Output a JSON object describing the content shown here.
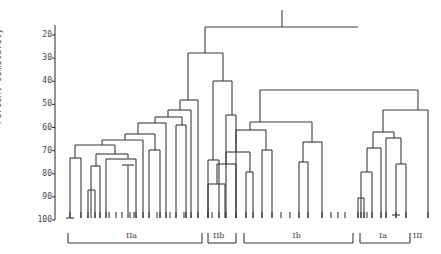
{
  "chart_data": {
    "type": "dendrogram",
    "title": "",
    "ylabel": "Percent similarity",
    "xlabel": "",
    "ylim": [
      20,
      100
    ],
    "yticks": [
      20,
      30,
      40,
      50,
      60,
      70,
      80,
      90,
      100
    ],
    "groups": [
      {
        "label": "IIa",
        "x1": 68,
        "x2": 202
      },
      {
        "label": "IIb",
        "x1": 208,
        "x2": 236
      },
      {
        "label": "Ib",
        "x1": 244,
        "x2": 353
      },
      {
        "label": "Ia",
        "x1": 360,
        "x2": 410
      },
      {
        "label": "III",
        "x1": 412,
        "x2": 412
      }
    ],
    "approx_merge_levels": {
      "root": 23,
      "II_cluster": 31,
      "IIb_internal": 40,
      "IIa_top": 48,
      "I_cluster": 45,
      "Ib_top": 60,
      "Ia_plus_III": 53,
      "Ia_top": 62
    },
    "leaf_count": 50
  },
  "axis": {
    "x": 55,
    "y_for_20": 35,
    "y_for_100": 220
  },
  "segments": [
    [
      282,
      10,
      282,
      27
    ],
    [
      205,
      27,
      358,
      27
    ],
    [
      205,
      27,
      205,
      53
    ],
    [
      188,
      53,
      223,
      53
    ],
    [
      223,
      53,
      223,
      81
    ],
    [
      213,
      81,
      232,
      81
    ],
    [
      213,
      81,
      213,
      160
    ],
    [
      208,
      160,
      219,
      160
    ],
    [
      208,
      160,
      208,
      218
    ],
    [
      219,
      160,
      219,
      218
    ],
    [
      232,
      81,
      232,
      115
    ],
    [
      226,
      115,
      236,
      115
    ],
    [
      226,
      115,
      226,
      218
    ],
    [
      236,
      115,
      236,
      218
    ],
    [
      188,
      53,
      188,
      100
    ],
    [
      180,
      100,
      198,
      100
    ],
    [
      198,
      100,
      198,
      218
    ],
    [
      180,
      100,
      180,
      110
    ],
    [
      168,
      110,
      191,
      110
    ],
    [
      191,
      110,
      191,
      218
    ],
    [
      168,
      110,
      168,
      117
    ],
    [
      155,
      117,
      182,
      117
    ],
    [
      182,
      117,
      182,
      125
    ],
    [
      176,
      125,
      186,
      125
    ],
    [
      176,
      125,
      176,
      218
    ],
    [
      186,
      125,
      186,
      218
    ],
    [
      155,
      117,
      155,
      123
    ],
    [
      138,
      123,
      166,
      123
    ],
    [
      166,
      123,
      166,
      218
    ],
    [
      138,
      123,
      138,
      134
    ],
    [
      125,
      134,
      155,
      134
    ],
    [
      155,
      134,
      155,
      150
    ],
    [
      149,
      150,
      160,
      150
    ],
    [
      149,
      150,
      149,
      218
    ],
    [
      160,
      150,
      160,
      218
    ],
    [
      125,
      134,
      125,
      140
    ],
    [
      102,
      140,
      143,
      140
    ],
    [
      143,
      140,
      143,
      218
    ],
    [
      102,
      140,
      102,
      145
    ],
    [
      75,
      145,
      115,
      145
    ],
    [
      75,
      145,
      75,
      158
    ],
    [
      70,
      158,
      81,
      158
    ],
    [
      70,
      158,
      70,
      218
    ],
    [
      81,
      158,
      81,
      218
    ],
    [
      66,
      218,
      74,
      218
    ],
    [
      115,
      145,
      115,
      154
    ],
    [
      96,
      154,
      128,
      154
    ],
    [
      96,
      154,
      96,
      166
    ],
    [
      91,
      166,
      100,
      166
    ],
    [
      91,
      166,
      91,
      218
    ],
    [
      100,
      166,
      100,
      218
    ],
    [
      88,
      190,
      95,
      190
    ],
    [
      88,
      190,
      88,
      218
    ],
    [
      95,
      190,
      95,
      218
    ],
    [
      128,
      154,
      128,
      159
    ],
    [
      106,
      159,
      136,
      159
    ],
    [
      136,
      159,
      136,
      218
    ],
    [
      106,
      159,
      106,
      218
    ],
    [
      128,
      165,
      128,
      218
    ],
    [
      122,
      165,
      134,
      165
    ],
    [
      358,
      90,
      358,
      90
    ],
    [
      260,
      90,
      418,
      90
    ],
    [
      260,
      90,
      260,
      122
    ],
    [
      250,
      122,
      312,
      122
    ],
    [
      250,
      122,
      250,
      130
    ],
    [
      236,
      130,
      266,
      130
    ],
    [
      236,
      130,
      236,
      152
    ],
    [
      226,
      152,
      250,
      152
    ],
    [
      250,
      152,
      250,
      172
    ],
    [
      246,
      172,
      253,
      172
    ],
    [
      246,
      172,
      246,
      218
    ],
    [
      253,
      172,
      253,
      218
    ],
    [
      226,
      152,
      226,
      164
    ],
    [
      217,
      164,
      236,
      164
    ],
    [
      236,
      164,
      236,
      218
    ],
    [
      217,
      164,
      217,
      184
    ],
    [
      208,
      184,
      225,
      184
    ],
    [
      225,
      184,
      225,
      218
    ],
    [
      208,
      184,
      208,
      218
    ],
    [
      266,
      130,
      266,
      150
    ],
    [
      262,
      150,
      272,
      150
    ],
    [
      262,
      150,
      262,
      218
    ],
    [
      272,
      150,
      272,
      218
    ],
    [
      312,
      122,
      312,
      142
    ],
    [
      303,
      142,
      322,
      142
    ],
    [
      322,
      142,
      322,
      218
    ],
    [
      303,
      142,
      303,
      162
    ],
    [
      299,
      162,
      308,
      162
    ],
    [
      299,
      162,
      299,
      218
    ],
    [
      308,
      162,
      308,
      218
    ],
    [
      418,
      90,
      418,
      110
    ],
    [
      383,
      110,
      428,
      110
    ],
    [
      428,
      110,
      428,
      218
    ],
    [
      383,
      110,
      383,
      132
    ],
    [
      373,
      132,
      394,
      132
    ],
    [
      373,
      132,
      373,
      148
    ],
    [
      367,
      148,
      381,
      148
    ],
    [
      381,
      148,
      381,
      218
    ],
    [
      367,
      148,
      367,
      172
    ],
    [
      361,
      172,
      372,
      172
    ],
    [
      361,
      172,
      361,
      218
    ],
    [
      372,
      172,
      372,
      218
    ],
    [
      358,
      198,
      364,
      198
    ],
    [
      358,
      198,
      358,
      218
    ],
    [
      364,
      198,
      364,
      218
    ],
    [
      394,
      132,
      394,
      138
    ],
    [
      386,
      138,
      401,
      138
    ],
    [
      386,
      138,
      386,
      218
    ],
    [
      401,
      138,
      401,
      164
    ],
    [
      396,
      164,
      406,
      164
    ],
    [
      396,
      164,
      396,
      218
    ],
    [
      406,
      164,
      406,
      218
    ],
    [
      392,
      215,
      400,
      215
    ]
  ],
  "leaves_x": [
    70,
    81,
    88,
    95,
    100,
    106,
    109,
    116,
    122,
    130,
    134,
    136,
    143,
    149,
    157,
    160,
    166,
    170,
    176,
    184,
    186,
    191,
    198,
    208,
    212,
    219,
    226,
    236,
    246,
    253,
    262,
    272,
    281,
    290,
    299,
    308,
    322,
    331,
    338,
    345,
    358,
    361,
    364,
    367,
    372,
    381,
    386,
    396,
    406,
    428
  ]
}
